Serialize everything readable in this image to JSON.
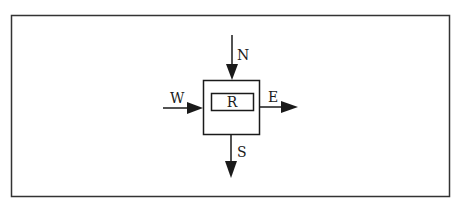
{
  "diagram": {
    "center_label": "R",
    "arrows": {
      "north": {
        "label": "N",
        "direction": "inward"
      },
      "west": {
        "label": "W",
        "direction": "inward"
      },
      "east": {
        "label": "E",
        "direction": "outward"
      },
      "south": {
        "label": "S",
        "direction": "outward"
      }
    },
    "colors": {
      "stroke": "#1a1a1a",
      "background": "#ffffff",
      "frame": "#333333"
    }
  }
}
